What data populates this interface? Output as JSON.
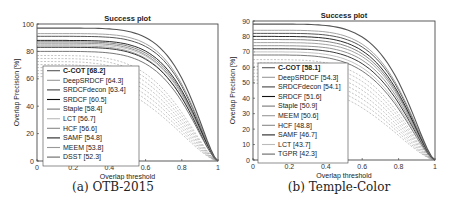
{
  "chart_data": [
    {
      "type": "line",
      "title": "Success plot",
      "xlabel": "Overlap threshold",
      "ylabel": "Overlap Precision [%]",
      "caption": "(a) OTB-2015",
      "xlim": [
        0,
        1
      ],
      "ylim": [
        0,
        100
      ],
      "xticks": [
        "0",
        "0.2",
        "0.4",
        "0.6",
        "0.8",
        "1"
      ],
      "yticks": [
        "0",
        "20",
        "40",
        "60",
        "80",
        "100"
      ],
      "legend_position": "lower-left inside",
      "series": [
        {
          "name": "C-COT [68.2]",
          "score": 68.2,
          "start": 97,
          "style": "solid",
          "color": "#555555",
          "bold": true
        },
        {
          "name": "DeepSRDCF [64.3]",
          "score": 64.3,
          "start": 93,
          "style": "solid",
          "color": "#999999"
        },
        {
          "name": "SRDCFdecon [63.4]",
          "score": 63.4,
          "start": 91,
          "style": "solid",
          "color": "#444444"
        },
        {
          "name": "SRDCF [60.5]",
          "score": 60.5,
          "start": 88,
          "style": "solid",
          "color": "#111111"
        },
        {
          "name": "Staple [58.4]",
          "score": 58.4,
          "start": 87,
          "style": "solid",
          "color": "#777777"
        },
        {
          "name": "LCT [56.7]",
          "score": 56.7,
          "start": 85,
          "style": "solid",
          "color": "#bbbbbb"
        },
        {
          "name": "HCF [56.6]",
          "score": 56.6,
          "start": 86,
          "style": "solid",
          "color": "#888888"
        },
        {
          "name": "SAMF [54.8]",
          "score": 54.8,
          "start": 83,
          "style": "solid",
          "color": "#222222"
        },
        {
          "name": "MEEM [53.8]",
          "score": 53.8,
          "start": 84,
          "style": "solid",
          "color": "#999999"
        },
        {
          "name": "DSST [52.3]",
          "score": 52.3,
          "start": 80,
          "style": "solid",
          "color": "#666666"
        }
      ]
    },
    {
      "type": "line",
      "title": "Success plot",
      "xlabel": "Overlap threshold",
      "ylabel": "Overlap Precision [%]",
      "caption": "(b) Temple-Color",
      "xlim": [
        0,
        1
      ],
      "ylim": [
        0,
        90
      ],
      "xticks": [
        "0",
        "0.2",
        "0.4",
        "0.6",
        "0.8",
        "1"
      ],
      "yticks": [
        "0",
        "10",
        "20",
        "30",
        "40",
        "50",
        "60",
        "70",
        "80",
        "90"
      ],
      "legend_position": "lower-left inside",
      "series": [
        {
          "name": "C-COT [58.1]",
          "score": 58.1,
          "start": 88,
          "style": "solid",
          "color": "#555555",
          "bold": true
        },
        {
          "name": "DeepSRDCF [54.3]",
          "score": 54.3,
          "start": 84,
          "style": "solid",
          "color": "#999999"
        },
        {
          "name": "SRDCFdecon [54.1]",
          "score": 54.1,
          "start": 82,
          "style": "solid",
          "color": "#444444"
        },
        {
          "name": "SRDCF [51.6]",
          "score": 51.6,
          "start": 80,
          "style": "solid",
          "color": "#111111"
        },
        {
          "name": "Staple [50.9]",
          "score": 50.9,
          "start": 78,
          "style": "solid",
          "color": "#777777"
        },
        {
          "name": "MEEM [50.6]",
          "score": 50.6,
          "start": 76,
          "style": "solid",
          "color": "#999999"
        },
        {
          "name": "HCF [48.8]",
          "score": 48.8,
          "start": 74,
          "style": "solid",
          "color": "#888888"
        },
        {
          "name": "SAMF [46.7]",
          "score": 46.7,
          "start": 72,
          "style": "solid",
          "color": "#222222"
        },
        {
          "name": "LCT [43.7]",
          "score": 43.7,
          "start": 70,
          "style": "solid",
          "color": "#bbbbbb"
        },
        {
          "name": "TGPR [42.3]",
          "score": 42.3,
          "start": 68,
          "style": "solid",
          "color": "#666666"
        }
      ]
    }
  ]
}
